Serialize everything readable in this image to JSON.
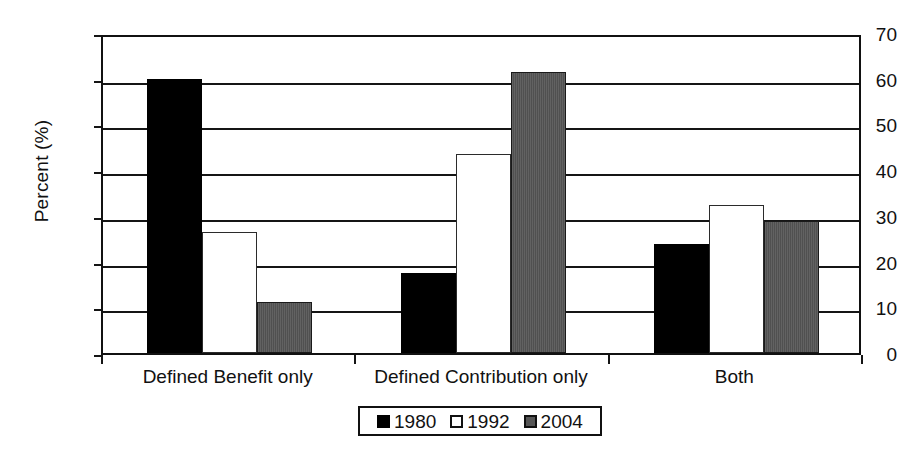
{
  "chart_data": {
    "type": "bar",
    "title": "",
    "xlabel": "",
    "ylabel": "Percent (%)",
    "ylim": [
      0,
      70
    ],
    "ytick_step": 10,
    "yticks": [
      "70",
      "60",
      "50",
      "40",
      "30",
      "20",
      "10",
      "0"
    ],
    "grid": true,
    "legend_position": "bottom",
    "categories": [
      "Defined Benefit only",
      "Defined Contribution only",
      "Both"
    ],
    "series": [
      {
        "name": "1980",
        "swatch": "s1980",
        "color": "#000000",
        "values": [
          60.0,
          17.5,
          23.8
        ]
      },
      {
        "name": "1992",
        "swatch": "s1992",
        "color": "#ffffff",
        "values": [
          26.5,
          43.5,
          32.4
        ]
      },
      {
        "name": "2004",
        "swatch": "s2004",
        "color": "#565656",
        "values": [
          11.2,
          61.5,
          28.9
        ]
      }
    ]
  },
  "legend": {
    "items": [
      {
        "label": "1980",
        "swatch": "s1980"
      },
      {
        "label": "1992",
        "swatch": "s1992"
      },
      {
        "label": "2004",
        "swatch": "s2004"
      }
    ]
  }
}
